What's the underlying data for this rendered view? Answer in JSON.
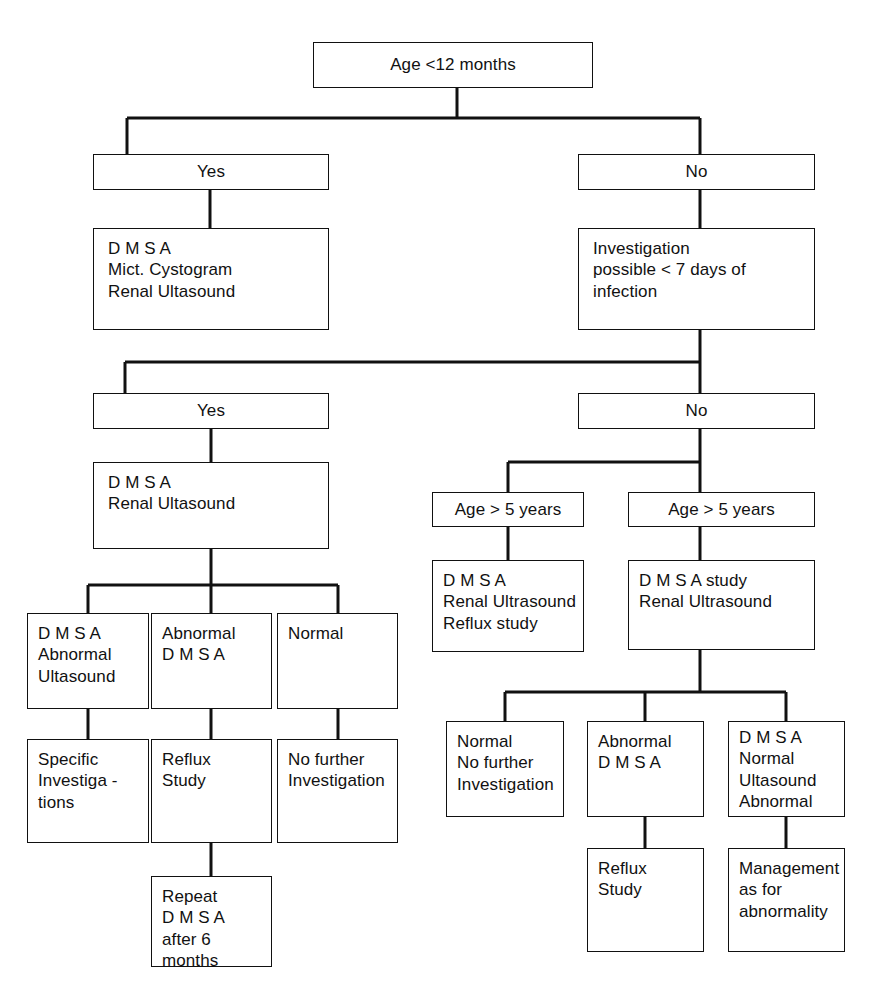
{
  "diagram": {
    "stroke_color": "#111111",
    "background_color": "#ffffff",
    "nodes": {
      "root": "Age <12 months",
      "branch1_yes": "Yes",
      "branch1_no": "No",
      "yes_tests": "D M S A\nMict. Cystogram\nRenal Ultasound",
      "investigation_window": "Investigation\npossible < 7 days of infection",
      "branch2_yes": "Yes",
      "branch2_no": "No",
      "yes2_tests": "D M S A\nRenal Ultasound",
      "age5_left": "Age > 5 years",
      "age5_right": "Age > 5 years",
      "age5_left_tests": "D M S A\nRenal Ultrasound\nReflux study",
      "age5_right_tests": "D M S A study\nRenal Ultrasound",
      "left_outcome_1": "D M S A\nAbnormal\nUltasound",
      "left_outcome_2": "Abnormal\nD M S A",
      "left_outcome_3": "Normal",
      "left_action_1": "Specific\nInvestiga -\ntions",
      "left_action_2": "Reflux\nStudy",
      "left_action_3": "No further\nInvestigation",
      "left_followup": "Repeat\nD M S A\nafter 6 months",
      "right_outcome_1": "Normal\nNo further\nInvestigation",
      "right_outcome_2": "Abnormal\nD M S A",
      "right_outcome_3": "D M S A\nNormal\nUltasound\nAbnormal",
      "right_action_2": "Reflux\nStudy",
      "right_action_3": "Management\nas for\nabnormality"
    }
  }
}
